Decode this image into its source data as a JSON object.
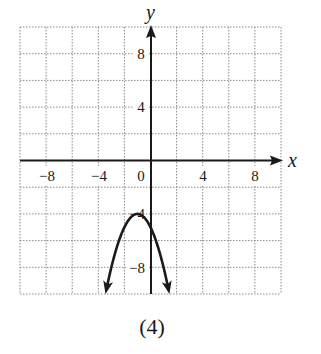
{
  "chart_data": {
    "type": "line",
    "title": "",
    "caption": "(4)",
    "xlabel": "x",
    "ylabel": "y",
    "xlim": [
      -10,
      10
    ],
    "ylim": [
      -10,
      10
    ],
    "grid": true,
    "grid_step": 2,
    "grid_style": "dotted",
    "x_ticks": [
      -8,
      -4,
      0,
      4,
      8
    ],
    "x_tick_labels": [
      "−8",
      "−4",
      "0",
      "4",
      "8"
    ],
    "y_ticks": [
      8,
      4,
      -4,
      -8
    ],
    "y_tick_labels": [
      "8",
      "4",
      "−4",
      "−8"
    ],
    "series": [
      {
        "name": "parabola",
        "equation": "y = -(x + 1)^2 - 4",
        "vertex": [
          -1,
          -4
        ],
        "opens": "down",
        "arrows_both_ends": true,
        "x": [
          -3.45,
          -3,
          -2.5,
          -2,
          -1.5,
          -1,
          -0.5,
          0,
          0.5,
          1,
          1.45
        ],
        "y": [
          -10,
          -8,
          -6.25,
          -5,
          -4.25,
          -4,
          -4.25,
          -5,
          -6.25,
          -8,
          -10
        ]
      }
    ],
    "legend": null
  },
  "labels": {
    "x_axis": "x",
    "y_axis": "y",
    "caption": "(4)",
    "tick_x_neg8": "−8",
    "tick_x_neg4": "−4",
    "tick_x_0": "0",
    "tick_x_4": "4",
    "tick_x_8": "8",
    "tick_y_8": "8",
    "tick_y_4": "4",
    "tick_y_neg4": "−4",
    "tick_y_neg8": "−8"
  },
  "colors": {
    "ink": "#1a1a1a",
    "grid": "#8a8a8a",
    "background": "#ffffff"
  }
}
